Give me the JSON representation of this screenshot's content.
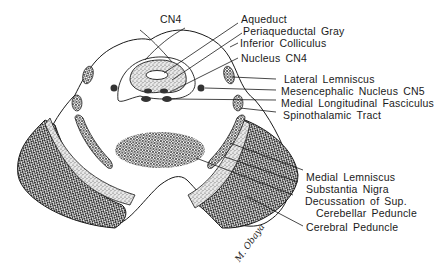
{
  "figure": {
    "type": "anatomical cross-section",
    "colors": {
      "ink": "#1a1a1a",
      "background": "#ffffff",
      "stipple": "#9a9a9a",
      "crosshatch": "#3a3a3a"
    }
  },
  "labels": {
    "cn4_top": "CN4",
    "aqueduct": "Aqueduct",
    "periaqueductal_gray": "Periaqueductal Gray",
    "inferior_colliculus": "Inferior Colliculus",
    "nucleus_cn4": "Nucleus CN4",
    "lateral_lemniscus": "Lateral Lemniscus",
    "mesencephalic_nucleus_cn5": "Mesencephalic Nucleus CN5",
    "medial_longitudinal_fasciculus": "Medial Longitudinal Fasciculus",
    "spinothalamic_tract": "Spinothalamic Tract",
    "medial_lemniscus": "Medial Lemniscus",
    "substantia_nigra": "Substantia Nigra",
    "decussation_line1": "Decussation of Sup.",
    "decussation_line2": "Cerebellar Peduncle",
    "cerebral_peduncle": "Cerebral Peduncle"
  },
  "signature": "M. Obaya"
}
